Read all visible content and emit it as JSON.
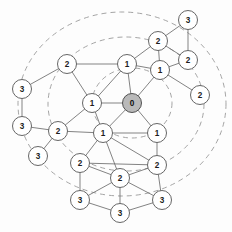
{
  "figure": {
    "background_color": "#fdfdfd",
    "node_fill_color": "#ffffff",
    "hub_fill_color": "#b9b9b9",
    "node_stroke_color": "#5e5e5e",
    "edge_color": "#6d6d6d",
    "ring_color": "#9a9a9a",
    "label_color": "#1d1d1d"
  },
  "chart_data": {
    "type": "diagram",
    "subtype": "node-link-graph",
    "xlabel": "",
    "ylabel": "",
    "grid": false,
    "legend": [],
    "annotations": [],
    "node_radius": 9.5,
    "hub_node_radius": 9.5,
    "label_values_present": [
      "0",
      "1",
      "2",
      "3"
    ],
    "node_count": 23,
    "edge_count": 38,
    "ring_count": 3,
    "center": {
      "x": 132,
      "y": 103
    },
    "nodes": [
      {
        "id": "n0",
        "label": "0",
        "x": 132,
        "y": 103,
        "hub": true
      },
      {
        "id": "n1",
        "label": "1",
        "x": 127,
        "y": 64,
        "hub": false
      },
      {
        "id": "n2",
        "label": "1",
        "x": 92,
        "y": 103,
        "hub": false
      },
      {
        "id": "n3",
        "label": "1",
        "x": 160,
        "y": 70,
        "hub": false
      },
      {
        "id": "n4",
        "label": "1",
        "x": 103,
        "y": 133,
        "hub": false
      },
      {
        "id": "n5",
        "label": "1",
        "x": 157,
        "y": 133,
        "hub": false
      },
      {
        "id": "n6",
        "label": "2",
        "x": 67,
        "y": 64,
        "hub": false
      },
      {
        "id": "n7",
        "label": "2",
        "x": 158,
        "y": 41,
        "hub": false
      },
      {
        "id": "n8",
        "label": "2",
        "x": 188,
        "y": 60,
        "hub": false
      },
      {
        "id": "n9",
        "label": "2",
        "x": 200,
        "y": 95,
        "hub": false
      },
      {
        "id": "n10",
        "label": "2",
        "x": 58,
        "y": 131,
        "hub": false
      },
      {
        "id": "n11",
        "label": "2",
        "x": 80,
        "y": 163,
        "hub": false
      },
      {
        "id": "n12",
        "label": "2",
        "x": 120,
        "y": 178,
        "hub": false
      },
      {
        "id": "n13",
        "label": "2",
        "x": 157,
        "y": 165,
        "hub": false
      },
      {
        "id": "n14",
        "label": "3",
        "x": 188,
        "y": 20,
        "hub": false
      },
      {
        "id": "n15",
        "label": "3",
        "x": 22,
        "y": 89,
        "hub": false
      },
      {
        "id": "n16",
        "label": "3",
        "x": 22,
        "y": 126,
        "hub": false
      },
      {
        "id": "n17",
        "label": "3",
        "x": 38,
        "y": 156,
        "hub": false
      },
      {
        "id": "n18",
        "label": "3",
        "x": 80,
        "y": 200,
        "hub": false
      },
      {
        "id": "n19",
        "label": "3",
        "x": 120,
        "y": 213,
        "hub": false
      },
      {
        "id": "n20",
        "label": "3",
        "x": 162,
        "y": 200,
        "hub": false
      }
    ],
    "edges": [
      {
        "source": "n0",
        "target": "n1"
      },
      {
        "source": "n0",
        "target": "n2"
      },
      {
        "source": "n0",
        "target": "n3"
      },
      {
        "source": "n0",
        "target": "n4"
      },
      {
        "source": "n0",
        "target": "n5"
      },
      {
        "source": "n1",
        "target": "n2"
      },
      {
        "source": "n1",
        "target": "n6"
      },
      {
        "source": "n1",
        "target": "n7"
      },
      {
        "source": "n1",
        "target": "n3"
      },
      {
        "source": "n2",
        "target": "n6"
      },
      {
        "source": "n2",
        "target": "n4"
      },
      {
        "source": "n2",
        "target": "n10"
      },
      {
        "source": "n3",
        "target": "n7"
      },
      {
        "source": "n3",
        "target": "n8"
      },
      {
        "source": "n3",
        "target": "n9"
      },
      {
        "source": "n4",
        "target": "n5"
      },
      {
        "source": "n4",
        "target": "n10"
      },
      {
        "source": "n4",
        "target": "n11"
      },
      {
        "source": "n4",
        "target": "n12"
      },
      {
        "source": "n4",
        "target": "n13"
      },
      {
        "source": "n5",
        "target": "n13"
      },
      {
        "source": "n6",
        "target": "n15"
      },
      {
        "source": "n7",
        "target": "n8"
      },
      {
        "source": "n7",
        "target": "n14"
      },
      {
        "source": "n8",
        "target": "n14"
      },
      {
        "source": "n10",
        "target": "n16"
      },
      {
        "source": "n10",
        "target": "n17"
      },
      {
        "source": "n11",
        "target": "n12"
      },
      {
        "source": "n11",
        "target": "n13"
      },
      {
        "source": "n11",
        "target": "n18"
      },
      {
        "source": "n12",
        "target": "n13"
      },
      {
        "source": "n12",
        "target": "n18"
      },
      {
        "source": "n12",
        "target": "n19"
      },
      {
        "source": "n12",
        "target": "n20"
      },
      {
        "source": "n13",
        "target": "n20"
      },
      {
        "source": "n15",
        "target": "n16"
      },
      {
        "source": "n18",
        "target": "n19"
      },
      {
        "source": "n19",
        "target": "n20"
      }
    ],
    "rings": [
      {
        "id": "r1",
        "cx": 132,
        "cy": 103,
        "rx": 40,
        "ry": 35,
        "rotation": 0
      },
      {
        "id": "r2",
        "cx": 126,
        "cy": 104,
        "rx": 78,
        "ry": 67,
        "rotation": 0
      },
      {
        "id": "r3",
        "cx": 122,
        "cy": 104,
        "rx": 104,
        "ry": 92,
        "rotation": 0
      }
    ]
  }
}
